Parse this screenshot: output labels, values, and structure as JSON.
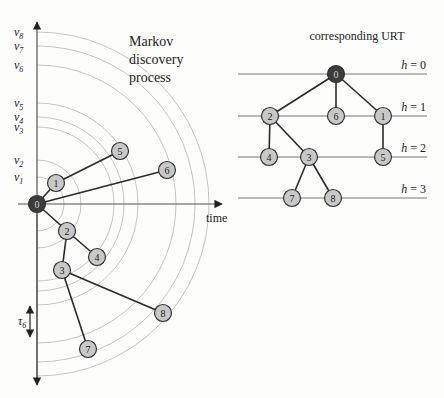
{
  "left_panel": {
    "title_lines": [
      "Markov",
      "discovery",
      "process"
    ],
    "x_axis_label": "time",
    "tau_label": "τ",
    "tau_sub": "6",
    "origin": [
      37,
      204
    ],
    "arcs": [
      {
        "label": "v",
        "sub": "1",
        "radius": 27
      },
      {
        "label": "v",
        "sub": "2",
        "radius": 44
      },
      {
        "label": "v",
        "sub": "3",
        "radius": 77
      },
      {
        "label": "v",
        "sub": "4",
        "radius": 87
      },
      {
        "label": "v",
        "sub": "5",
        "radius": 101
      },
      {
        "label": "v",
        "sub": "6",
        "radius": 139
      },
      {
        "label": "v",
        "sub": "7",
        "radius": 158
      },
      {
        "label": "v",
        "sub": "8",
        "radius": 172
      }
    ],
    "nodes": [
      {
        "id": "0",
        "x": 37,
        "y": 204,
        "root": true
      },
      {
        "id": "1",
        "x": 56,
        "y": 183
      },
      {
        "id": "5",
        "x": 120,
        "y": 151
      },
      {
        "id": "6",
        "x": 167,
        "y": 170
      },
      {
        "id": "2",
        "x": 67,
        "y": 231
      },
      {
        "id": "4",
        "x": 97,
        "y": 257
      },
      {
        "id": "3",
        "x": 62,
        "y": 270
      },
      {
        "id": "8",
        "x": 163,
        "y": 313
      },
      {
        "id": "7",
        "x": 88,
        "y": 349
      }
    ],
    "edges": [
      [
        "0",
        "1"
      ],
      [
        "1",
        "5"
      ],
      [
        "0",
        "6"
      ],
      [
        "0",
        "2"
      ],
      [
        "2",
        "4"
      ],
      [
        "2",
        "3"
      ],
      [
        "3",
        "8"
      ],
      [
        "3",
        "7"
      ]
    ]
  },
  "right_panel": {
    "title": "corresponding URT",
    "levels": [
      {
        "label": "h = 0",
        "y": 74
      },
      {
        "label": "h = 1",
        "y": 116
      },
      {
        "label": "h = 2",
        "y": 157
      },
      {
        "label": "h = 3",
        "y": 198
      }
    ],
    "nodes": [
      {
        "id": "0",
        "x": 336,
        "y": 74,
        "root": true
      },
      {
        "id": "2",
        "x": 270,
        "y": 116
      },
      {
        "id": "6",
        "x": 336,
        "y": 116
      },
      {
        "id": "1",
        "x": 383,
        "y": 116
      },
      {
        "id": "4",
        "x": 269,
        "y": 157
      },
      {
        "id": "3",
        "x": 309,
        "y": 157
      },
      {
        "id": "5",
        "x": 383,
        "y": 157
      },
      {
        "id": "7",
        "x": 292,
        "y": 198
      },
      {
        "id": "8",
        "x": 333,
        "y": 198
      }
    ],
    "edges": [
      [
        "0",
        "2"
      ],
      [
        "0",
        "6"
      ],
      [
        "0",
        "1"
      ],
      [
        "2",
        "4"
      ],
      [
        "2",
        "3"
      ],
      [
        "1",
        "5"
      ],
      [
        "3",
        "7"
      ],
      [
        "3",
        "8"
      ]
    ]
  },
  "colors": {
    "node_fill": "#c8c8c8",
    "root_fill": "#3c3c3c",
    "arc": "#bdbdbd",
    "edge": "#2a2a2a"
  }
}
